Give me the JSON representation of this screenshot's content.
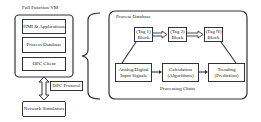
{
  "vm": {
    "title": "Full Function VM",
    "components": [
      {
        "label": "HMI & Applications"
      },
      {
        "label": "Process Database"
      },
      {
        "label": "OPC Client"
      }
    ],
    "protocol_label": "OPC Protocol",
    "network": "Network Simulators"
  },
  "process_db": {
    "title": "Process Database",
    "tags": [
      {
        "line1": "(Tag 1)",
        "line2": "Block"
      },
      {
        "line1": "(Tag 2)",
        "line2": "Block"
      },
      {
        "line1": "(Tag N)",
        "line2": "Block"
      }
    ],
    "chain": [
      {
        "line1": "Analog/Digital",
        "line2": "Input Signals"
      },
      {
        "line1": "Calculation",
        "line2": "(Algorithms)"
      },
      {
        "line1": "Trending",
        "line2": "(Prediction)"
      }
    ],
    "chain_label": "Processing Chain"
  }
}
